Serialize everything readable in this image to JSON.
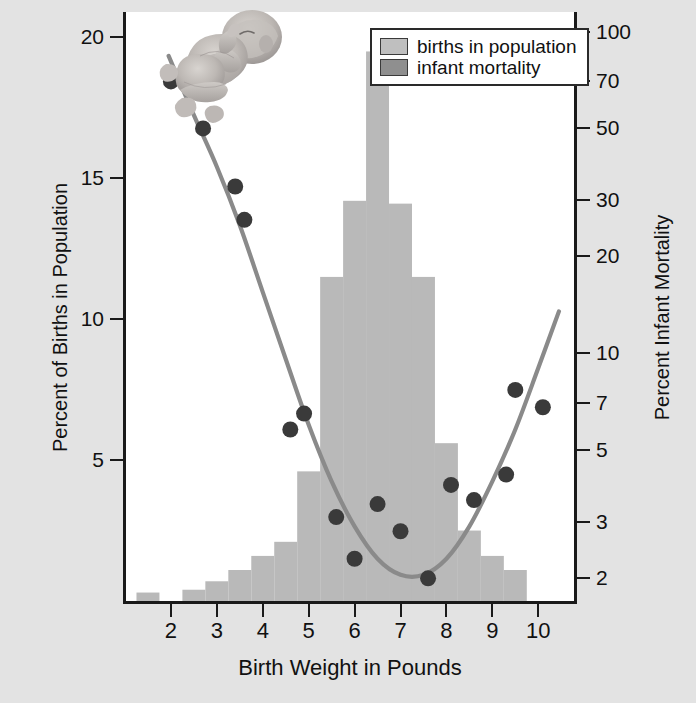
{
  "chart_data": {
    "type": "bar",
    "title": "",
    "xlabel": "Birth Weight in Pounds",
    "ylabel": "Percent of Births in Population",
    "ylabel_right": "Percent Infant Mortality",
    "xlim": [
      1.0,
      10.8
    ],
    "ylim_left": [
      0,
      20.9
    ],
    "ylim_right": [
      1.7,
      115
    ],
    "right_axis_scale": "log",
    "grid": false,
    "legend_position": "top-right",
    "x_ticks": [
      "2",
      "3",
      "4",
      "5",
      "6",
      "7",
      "8",
      "9",
      "10"
    ],
    "x_tick_values": [
      2,
      3,
      4,
      5,
      6,
      7,
      8,
      9,
      10
    ],
    "y_ticks_left": [
      "5",
      "10",
      "15",
      "20"
    ],
    "y_tick_values_left": [
      5,
      10,
      15,
      20
    ],
    "y_ticks_right": [
      "2",
      "3",
      "5",
      "7",
      "10",
      "20",
      "30",
      "50",
      "70",
      "100"
    ],
    "y_tick_values_right": [
      2,
      3,
      5,
      7,
      10,
      20,
      30,
      50,
      70,
      100
    ],
    "series": [
      {
        "name": "births in population",
        "type": "bar",
        "axis": "left",
        "color": "#b9b9b9",
        "bin_width": 0.5,
        "bin_starts": [
          1.25,
          1.75,
          2.25,
          2.75,
          3.25,
          3.75,
          4.25,
          4.75,
          5.25,
          5.75,
          6.25,
          6.75,
          7.25,
          7.75,
          8.25,
          8.75,
          9.25,
          9.75
        ],
        "categories": [
          "1.5",
          "2.0",
          "2.5",
          "3.0",
          "3.5",
          "4.0",
          "4.5",
          "5.0",
          "5.5",
          "6.0",
          "6.5",
          "7.0",
          "7.5",
          "8.0",
          "8.5",
          "9.0",
          "9.5",
          "10.0"
        ],
        "values": [
          0.3,
          0.0,
          0.4,
          0.7,
          1.1,
          1.6,
          2.1,
          4.6,
          11.5,
          14.2,
          19.5,
          14.1,
          11.5,
          5.6,
          2.5,
          1.6,
          1.1,
          0.0
        ]
      },
      {
        "name": "infant mortality",
        "type": "scatter",
        "axis": "right",
        "color": "#3a3a3a",
        "x": [
          2.0,
          2.7,
          3.4,
          3.6,
          4.6,
          4.9,
          5.6,
          6.0,
          6.5,
          7.0,
          7.6,
          8.1,
          8.6,
          9.3,
          9.5,
          10.1
        ],
        "y": [
          70,
          50,
          33,
          26,
          5.8,
          6.5,
          3.1,
          2.3,
          3.4,
          2.8,
          2.0,
          3.9,
          3.5,
          4.2,
          7.7,
          6.8
        ]
      },
      {
        "name": "infant mortality fitted curve",
        "type": "line",
        "axis": "right",
        "color": "#8a8a8a",
        "x": [
          1.95,
          2.5,
          3.0,
          3.5,
          4.0,
          4.5,
          5.0,
          5.5,
          6.0,
          6.5,
          7.0,
          7.5,
          8.0,
          8.5,
          9.0,
          9.5,
          10.0,
          10.45
        ],
        "y": [
          84,
          55,
          38,
          25,
          15.5,
          9.6,
          6.0,
          4.0,
          2.9,
          2.3,
          2.05,
          2.05,
          2.3,
          2.9,
          4.0,
          5.8,
          9.0,
          13.5
        ]
      }
    ]
  },
  "legend": {
    "items": [
      {
        "label": "births in population",
        "color": "#bfbfbf"
      },
      {
        "label": "infant mortality",
        "color": "#8f8f8f"
      }
    ]
  },
  "illustration": {
    "name": "newborn-baby-illustration",
    "alt": "pencil illustration of a newborn infant"
  },
  "colors": {
    "background": "#e3e3e3",
    "plot_background": "#ffffff",
    "axis": "#1a1a1a",
    "bar": "#b9b9b9",
    "dot": "#3a3a3a",
    "curve": "#8a8a8a"
  }
}
